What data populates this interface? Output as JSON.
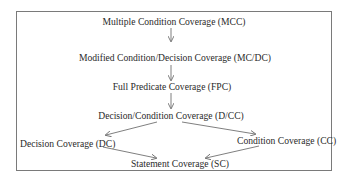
{
  "diagram": {
    "type": "hierarchy",
    "nodes": [
      {
        "id": "mcc",
        "label": "Multiple Condition Coverage (MCC)"
      },
      {
        "id": "mcdc",
        "label": "Modified Condition/Decision Coverage (MC/DC)"
      },
      {
        "id": "fpc",
        "label": "Full Predicate Coverage (FPC)"
      },
      {
        "id": "dcc",
        "label": "Decision/Condition Coverage (D/CC)"
      },
      {
        "id": "dc",
        "label": "Decision Coverage (DC)"
      },
      {
        "id": "cc",
        "label": "Condition Coverage (CC)"
      },
      {
        "id": "sc",
        "label": "Statement Coverage (SC)"
      }
    ],
    "edges": [
      {
        "from": "mcc",
        "to": "mcdc"
      },
      {
        "from": "mcdc",
        "to": "fpc"
      },
      {
        "from": "fpc",
        "to": "dcc"
      },
      {
        "from": "dcc",
        "to": "dc"
      },
      {
        "from": "dcc",
        "to": "cc"
      },
      {
        "from": "dc",
        "to": "sc"
      },
      {
        "from": "cc",
        "to": "sc"
      }
    ],
    "colors": {
      "border": "#7a7a7a",
      "text": "#2a2a2a",
      "arrow": "#707070"
    }
  }
}
